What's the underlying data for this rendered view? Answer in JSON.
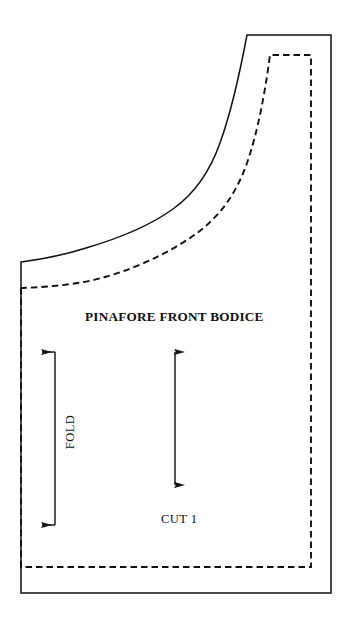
{
  "document": {
    "type": "sewing-pattern-piece",
    "background_color": "#ffffff",
    "line_color": "#111111",
    "width": 351,
    "height": 627
  },
  "labels": {
    "title": "PINAFORE FRONT BODICE",
    "cut_instruction": "CUT 1",
    "fold_marker": "FOLD"
  },
  "markings": {
    "grainline_name": "grainline-arrow",
    "grainline_orientation": "vertical-double-headed",
    "fold_bracket_name": "fold-bracket",
    "fold_bracket_arrows": "left-pointing-top-and-bottom",
    "cutting_line_style": "solid",
    "stitching_line_style": "dashed"
  },
  "geometry": {
    "cut_line_path": "M 21 262 L 21 593 L 331 593 L 331 35 L 247 35 C 233 96 216 163 180 205 C 146 243 96 259 21 262 Z",
    "seam_line_path": "M 21 288 L 21 567 L 311 567 L 311 55 L 269 55 C 260 112 245 173 207 216 C 171 256 104 282 21 288",
    "grainline": {
      "x": 175,
      "y_top": 341,
      "y_bottom": 496
    },
    "fold_bracket": {
      "x_vertical": 55,
      "y_top": 352,
      "y_bottom": 525,
      "arrow_tip_x": 31
    }
  }
}
